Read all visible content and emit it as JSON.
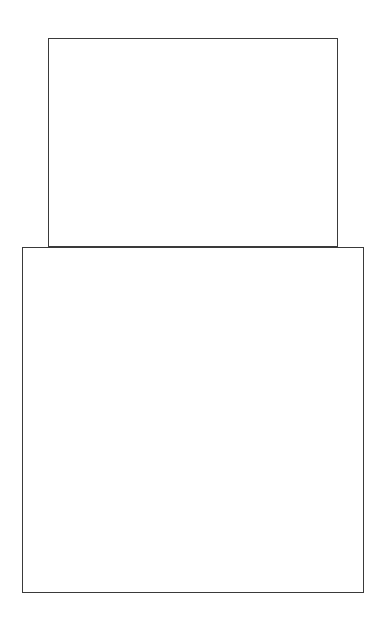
{
  "diagram": {
    "stroke_color": "#3a3a3a",
    "background_color": "#ffffff",
    "shapes": [
      {
        "id": "rect-top",
        "type": "rectangle",
        "x": 48,
        "y": 38,
        "width": 290,
        "height": 209
      },
      {
        "id": "rect-bottom",
        "type": "rectangle",
        "x": 22,
        "y": 247,
        "width": 342,
        "height": 346
      }
    ]
  }
}
